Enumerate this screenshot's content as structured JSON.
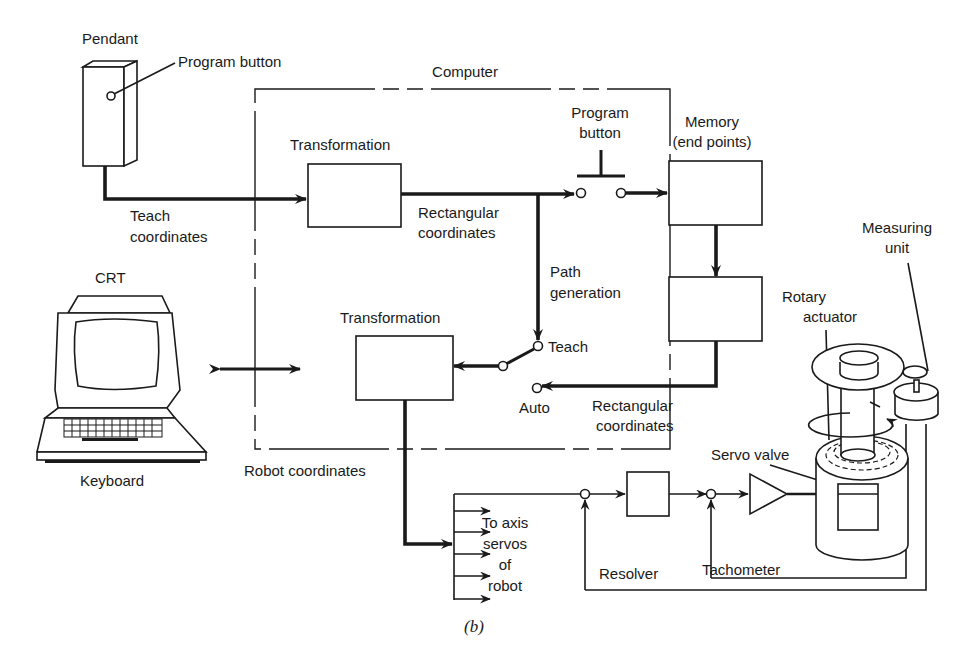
{
  "figure": {
    "caption": "(b)",
    "computer_boundary_label": "Computer"
  },
  "pendant": {
    "title": "Pendant",
    "button_label": "Program button",
    "output_label_line1": "Teach",
    "output_label_line2": "coordinates"
  },
  "blocks": {
    "transformation_top": "Transformation",
    "transformation_bottom": "Transformation",
    "memory_line1": "Memory",
    "memory_line2": "(end points)"
  },
  "signals": {
    "rect_coords_top_line1": "Rectangular",
    "rect_coords_top_line2": "coordinates",
    "path_gen_line1": "Path",
    "path_gen_line2": "generation",
    "program_button_line1": "Program",
    "program_button_line2": "button",
    "teach": "Teach",
    "auto": "Auto",
    "rect_coords_bottom_line1": "Rectangular",
    "rect_coords_bottom_line2": "coordinates",
    "robot_coordinates": "Robot coordinates"
  },
  "terminal": {
    "crt": "CRT",
    "keyboard": "Keyboard"
  },
  "servo": {
    "to_axis_line1": "To axis",
    "to_axis_line2": "servos",
    "to_axis_line3": "of",
    "to_axis_line4": "robot",
    "servo_valve": "Servo valve",
    "tachometer": "Tachometer",
    "resolver": "Resolver",
    "rotary_line1": "Rotary",
    "rotary_line2": "actuator",
    "measuring_line1": "Measuring",
    "measuring_line2": "unit"
  }
}
